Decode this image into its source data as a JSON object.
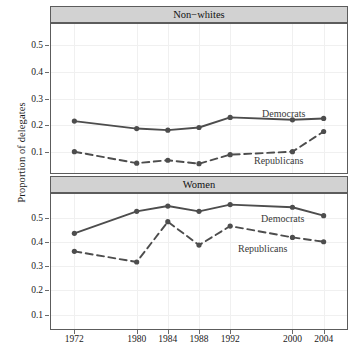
{
  "figure": {
    "ylabel": "Proportion of delegates",
    "line_color": "#4d4d4d",
    "strip_color": "#d2d2d2",
    "frame_color": "#5c5c5c"
  },
  "chart_data": {
    "type": "line",
    "title": "",
    "xlabel": "",
    "ylabel": "Proportion of delegates",
    "x": [
      1972,
      1980,
      1984,
      1988,
      1992,
      2000,
      2004
    ],
    "xlim": [
      1969,
      2007
    ],
    "xtick_labels": [
      "1972",
      "1980",
      "1984",
      "1988",
      "1992",
      "2000",
      "2004"
    ],
    "grid": true,
    "legend": "inline-annotations",
    "panels": [
      {
        "name": "Non-whites",
        "strip_label": "Non−whites",
        "ylim": [
          0.02,
          0.58
        ],
        "yticks": [
          0.1,
          0.2,
          0.3,
          0.4,
          0.5
        ],
        "ytick_labels": [
          "0.1",
          "0.2",
          "0.3",
          "0.4",
          "0.5"
        ],
        "series": [
          {
            "name": "Democrats",
            "style": "solid",
            "values": [
              0.215,
              0.187,
              0.181,
              0.191,
              0.229,
              0.22,
              0.225
            ],
            "annotation": "Democrats"
          },
          {
            "name": "Republicans",
            "style": "dashed",
            "values": [
              0.1,
              0.057,
              0.068,
              0.055,
              0.089,
              0.1,
              0.176
            ],
            "annotation": "Republicans"
          }
        ]
      },
      {
        "name": "Women",
        "strip_label": "Women",
        "ylim": [
          0.04,
          0.6
        ],
        "yticks": [
          0.1,
          0.2,
          0.3,
          0.4,
          0.5
        ],
        "ytick_labels": [
          "0.1",
          "0.2",
          "0.3",
          "0.4",
          "0.5"
        ],
        "series": [
          {
            "name": "Democrats",
            "style": "solid",
            "values": [
              0.437,
              0.528,
              0.55,
              0.528,
              0.556,
              0.545,
              0.51
            ],
            "annotation": "Democrats"
          },
          {
            "name": "Republicans",
            "style": "dashed",
            "values": [
              0.362,
              0.318,
              0.485,
              0.388,
              0.467,
              0.42,
              0.402
            ],
            "annotation": "Republicans"
          }
        ]
      }
    ]
  }
}
